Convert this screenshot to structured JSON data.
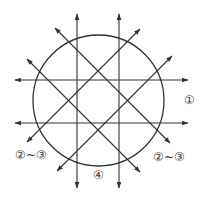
{
  "diagram": {
    "stroke_color": "#333333",
    "circle": {
      "cx": 98.5,
      "cy": 100.5,
      "r": 65.5
    },
    "lines": [
      {
        "id": "horizontal-top",
        "x1": 188,
        "y1": 80,
        "x2": 15,
        "y2": 80
      },
      {
        "id": "horizontal-bottom",
        "x1": 188,
        "y1": 123,
        "x2": 15,
        "y2": 123
      },
      {
        "id": "vertical-left",
        "x1": 77,
        "y1": 188,
        "x2": 77,
        "y2": 14
      },
      {
        "id": "vertical-right",
        "x1": 119,
        "y1": 188,
        "x2": 119,
        "y2": 14
      },
      {
        "id": "diagonal-backslash-a",
        "x1": 27,
        "y1": 59,
        "x2": 140,
        "y2": 172
      },
      {
        "id": "diagonal-backslash-b",
        "x1": 55,
        "y1": 28,
        "x2": 170,
        "y2": 143
      },
      {
        "id": "diagonal-slash-c",
        "x1": 140,
        "y1": 29,
        "x2": 27,
        "y2": 142
      },
      {
        "id": "diagonal-slash-d",
        "x1": 172,
        "y1": 56,
        "x2": 57,
        "y2": 171
      }
    ],
    "labels": {
      "right": "①",
      "lower_left": "②~③",
      "lower_right": "②~③",
      "bottom": "④"
    }
  }
}
